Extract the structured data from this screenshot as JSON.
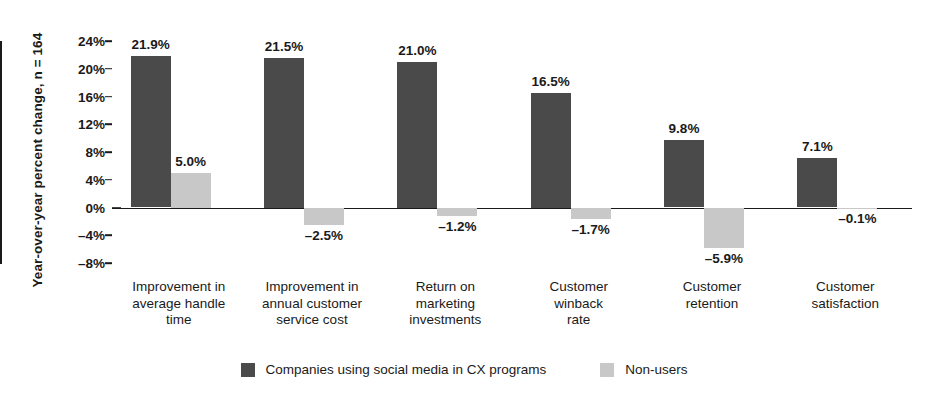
{
  "chart_data": {
    "type": "bar",
    "title": "",
    "xlabel": "",
    "ylabel": "Year-over-year percent change, n = 164",
    "ylim": [
      -8,
      24
    ],
    "ytick_step": 4,
    "ytick_labels": [
      "24%",
      "20%",
      "16%",
      "12%",
      "8%",
      "4%",
      "0%",
      "–4%",
      "–8%"
    ],
    "ytick_values": [
      24,
      20,
      16,
      12,
      8,
      4,
      0,
      -4,
      -8
    ],
    "grid": false,
    "legend_position": "bottom",
    "categories": [
      "Improvement in average handle time",
      "Improvement in annual customer service cost",
      "Return on marketing investments",
      "Customer winback rate",
      "Customer retention",
      "Customer satisfaction"
    ],
    "category_lines": [
      [
        "Improvement in",
        "average handle",
        "time"
      ],
      [
        "Improvement in",
        "annual customer",
        "service cost"
      ],
      [
        "Return on",
        "marketing",
        "investments"
      ],
      [
        "Customer",
        "winback",
        "rate"
      ],
      [
        "Customer",
        "retention"
      ],
      [
        "Customer",
        "satisfaction"
      ]
    ],
    "series": [
      {
        "name": "Companies using social media in CX programs",
        "color": "#4a4a4a",
        "values": [
          21.9,
          21.5,
          21.0,
          16.5,
          9.8,
          7.1
        ],
        "labels": [
          "21.9%",
          "21.5%",
          "21.0%",
          "16.5%",
          "9.8%",
          "7.1%"
        ]
      },
      {
        "name": "Non-users",
        "color": "#c8c8c8",
        "values": [
          5.0,
          -2.5,
          -1.2,
          -1.7,
          -5.9,
          -0.1
        ],
        "labels": [
          "5.0%",
          "–2.5%",
          "–1.2%",
          "–1.7%",
          "–5.9%",
          "–0.1%"
        ]
      }
    ]
  },
  "legend": {
    "items": [
      {
        "label": "Companies using social media in CX programs",
        "color": "#4a4a4a"
      },
      {
        "label": "Non-users",
        "color": "#c8c8c8"
      }
    ]
  },
  "colors": {
    "dark": "#4a4a4a",
    "light": "#c8c8c8",
    "axis": "#1a1a1a",
    "background": "#ffffff"
  }
}
